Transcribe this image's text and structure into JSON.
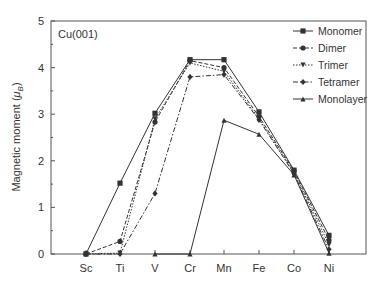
{
  "chart_data": {
    "type": "line",
    "title": "",
    "annotation": "Cu(001)",
    "xlabel": "",
    "ylabel": "Magnetic moment (μB)",
    "ylabel_parts": {
      "main": "Magnetic moment (",
      "mu": "μ",
      "sub": "B",
      "close": ")"
    },
    "categories": [
      "Sc",
      "Ti",
      "V",
      "Cr",
      "Mn",
      "Fe",
      "Co",
      "Ni"
    ],
    "ylim": [
      0,
      5
    ],
    "yticks": [
      0,
      1,
      2,
      3,
      4,
      5
    ],
    "grid": false,
    "legend_position": "upper right",
    "series": [
      {
        "name": "Monomer",
        "marker": "square",
        "dash": "solid",
        "values": [
          0,
          1.52,
          3.02,
          4.17,
          4.17,
          3.05,
          1.8,
          0.4
        ]
      },
      {
        "name": "Dimer",
        "marker": "circle",
        "dash": "dash",
        "values": [
          0,
          0.27,
          2.83,
          4.15,
          4.0,
          2.95,
          1.78,
          0.3
        ]
      },
      {
        "name": "Trimer",
        "marker": "triangle-down",
        "dash": "dot",
        "values": [
          0,
          0.02,
          2.9,
          4.1,
          3.92,
          2.9,
          1.75,
          0.2
        ]
      },
      {
        "name": "Tetramer",
        "marker": "diamond",
        "dash": "dashdot",
        "values": [
          0,
          0,
          1.3,
          3.8,
          3.85,
          2.88,
          1.72,
          0.1
        ]
      },
      {
        "name": "Monolayer",
        "marker": "triangle-up",
        "dash": "solid",
        "values": [
          null,
          null,
          0,
          0,
          2.87,
          2.57,
          1.7,
          0.02
        ]
      }
    ]
  }
}
